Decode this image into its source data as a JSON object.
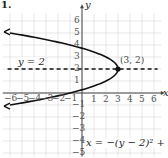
{
  "figure_label": "1.",
  "chart_data": {
    "type": "line",
    "title": "",
    "xlabel": "x",
    "ylabel": "y",
    "xlim": [
      -6,
      6
    ],
    "ylim": [
      -6,
      6
    ],
    "grid": true,
    "x_ticks": [
      -6,
      -5,
      -4,
      -3,
      -2,
      -1,
      1,
      2,
      3,
      4,
      5,
      6
    ],
    "y_ticks": [
      -5,
      -4,
      -3,
      -2,
      -1,
      1,
      2,
      3,
      4,
      5,
      6
    ],
    "series": [
      {
        "name": "x = -(y - 2)^2 + 3",
        "style": "solid",
        "equation": "x = -(y - 2)^2 + 3",
        "points": [
          {
            "x": -6,
            "y": 5
          },
          {
            "x": -3,
            "y": 4.45
          },
          {
            "x": -1,
            "y": 4
          },
          {
            "x": 2,
            "y": 3
          },
          {
            "x": 3,
            "y": 2
          },
          {
            "x": 2,
            "y": 1
          },
          {
            "x": -1,
            "y": 0
          },
          {
            "x": -3,
            "y": -0.45
          },
          {
            "x": -6,
            "y": -1
          }
        ]
      },
      {
        "name": "y = 2",
        "style": "dashed",
        "equation": "y = 2",
        "points": [
          {
            "x": -6,
            "y": 2
          },
          {
            "x": 6,
            "y": 2
          }
        ]
      }
    ],
    "annotations": [
      {
        "text": "(3, 2)",
        "x": 3,
        "y": 2,
        "type": "vertex"
      },
      {
        "text": "y = 2",
        "type": "axis-of-symmetry-label"
      },
      {
        "text": "x = −(y − 2)² + 3",
        "type": "equation-label"
      }
    ]
  },
  "labels": {
    "vertex": "(3, 2)",
    "symmetry": "y = 2",
    "equation": "x = −(y − 2)² + 3",
    "x_axis": "x",
    "y_axis": "y",
    "x_neg": [
      "−6",
      "−5",
      "−4",
      "−3",
      "−2",
      "−1"
    ],
    "x_pos": [
      "1",
      "2",
      "3",
      "4",
      "5",
      "6"
    ],
    "y_pos": [
      "1",
      "2",
      "3",
      "4",
      "5",
      "6"
    ],
    "y_neg": [
      "−1",
      "−2",
      "−3",
      "−4",
      "−5"
    ]
  }
}
